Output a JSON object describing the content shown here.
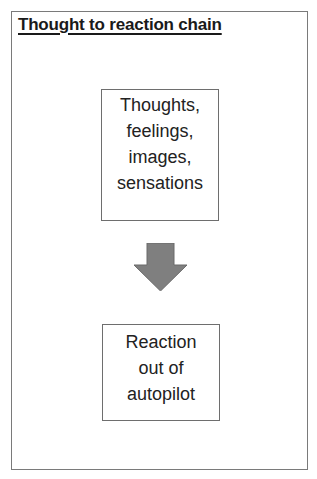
{
  "diagram": {
    "title": "Thought to reaction chain",
    "nodes": [
      {
        "id": "thoughts",
        "lines": [
          "Thoughts,",
          "feelings,",
          "images,",
          "sensations"
        ]
      },
      {
        "id": "reaction",
        "lines": [
          "Reaction",
          "out of",
          "autopilot"
        ]
      }
    ],
    "edges": [
      {
        "from": "thoughts",
        "to": "reaction",
        "style": "block-arrow-down"
      }
    ],
    "colors": {
      "border": "#6e6e6e",
      "arrow": "#7f7f7f",
      "text": "#222222"
    }
  }
}
